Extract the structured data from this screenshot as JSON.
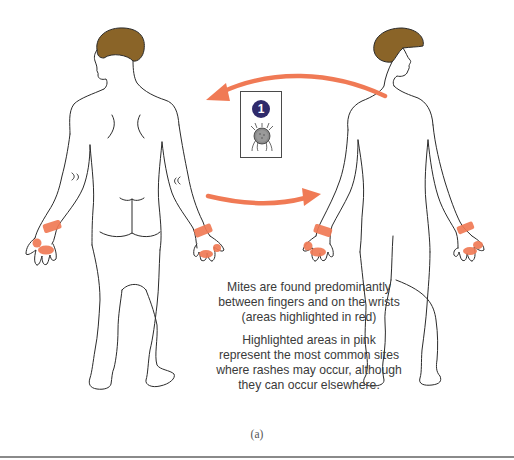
{
  "figure": {
    "badge_number": "1",
    "caption_red": [
      "Mites are found predominantly",
      "between fingers and on the wrists",
      "(areas highlighted in red)"
    ],
    "caption_pink": [
      "Highlighted areas in pink",
      "represent the most common sites",
      "where rashes may occur, although",
      "they can occur elsewhere."
    ],
    "sublabel": "(a)",
    "colors": {
      "highlight_red": "#f07a55",
      "hair": "#8a6428",
      "badge": "#2f2a6b",
      "outline": "#2b2b2b"
    },
    "figures": [
      {
        "view": "back",
        "highlights": [
          "left-wrist",
          "left-fingers",
          "right-wrist",
          "right-fingers"
        ]
      },
      {
        "view": "front",
        "highlights": [
          "left-wrist",
          "left-fingers",
          "right-wrist",
          "right-fingers"
        ]
      }
    ],
    "arrows": [
      {
        "direction": "right-to-left",
        "position": "top"
      },
      {
        "direction": "left-to-right",
        "position": "middle"
      }
    ],
    "icons": {
      "mite": "mite-icon",
      "badge": "number-badge-icon"
    }
  }
}
